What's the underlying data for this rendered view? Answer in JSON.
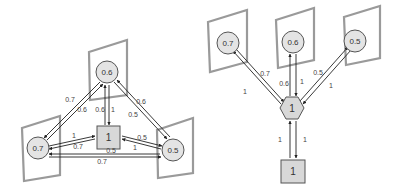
{
  "left_diagram": {
    "nodes": {
      "top": "0.6",
      "left": "0.7",
      "right": "0.5",
      "center": "1"
    },
    "edge_labels": {
      "top_left_a": "0.7",
      "top_left_b": "0.6",
      "top_center_a": "0.6",
      "top_center_b": "1",
      "top_right_a": "0.6",
      "top_right_b": "0.5",
      "left_center_a": "1",
      "left_center_b": "0.7",
      "right_center_a": "0.5",
      "right_center_b": "1",
      "left_right_a": "0.5",
      "left_right_b": "0.7"
    }
  },
  "right_diagram": {
    "nodes": {
      "left": "0.7",
      "middle": "0.6",
      "right": "0.5",
      "hub": "1",
      "bottom": "1"
    },
    "edge_labels": {
      "left_hub_a": "0.7",
      "left_hub_b": "1",
      "middle_hub_a": "0.6",
      "middle_hub_b": "1",
      "right_hub_a": "0.5",
      "right_hub_b": "1",
      "hub_bottom_a": "1",
      "hub_bottom_b": "1"
    }
  }
}
